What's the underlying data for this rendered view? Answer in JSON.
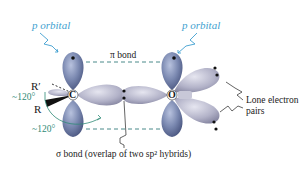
{
  "labels": {
    "p_orbital_left": "p orbital",
    "p_orbital_right": "p orbital",
    "pi_bond": "π bond",
    "r_prime": "R′",
    "r": "R",
    "angle_upper": "~120°",
    "angle_lower": "~120°",
    "carbon": "C",
    "oxygen": "O",
    "lone_pairs_line1": "Lone electron",
    "lone_pairs_line2": "pairs",
    "sigma_bond": "σ bond (overlap of two sp² hybrids)"
  },
  "colors": {
    "p_orbital": "#6f7ea8",
    "sp2_orbital": "#a8a8c0",
    "label_blue": "#3f9fd0",
    "angle_teal": "#2f8a76",
    "dashed_line": "#4a8a8a",
    "text": "#1a1a1a"
  }
}
